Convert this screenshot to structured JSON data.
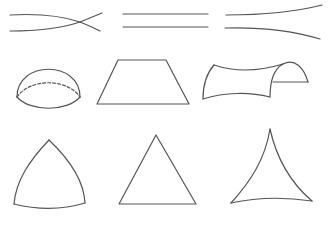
{
  "diagram": {
    "stroke_color": "#555555",
    "background": "#ffffff",
    "rows": [
      {
        "name": "lines",
        "items": [
          {
            "id": "converging-lines",
            "type": "lines",
            "geometry": "elliptic"
          },
          {
            "id": "parallel-lines",
            "type": "lines",
            "geometry": "euclidean"
          },
          {
            "id": "diverging-lines",
            "type": "lines",
            "geometry": "hyperbolic"
          }
        ]
      },
      {
        "name": "surfaces",
        "items": [
          {
            "id": "hemisphere",
            "type": "surface",
            "geometry": "elliptic"
          },
          {
            "id": "flat-plane",
            "type": "surface",
            "geometry": "euclidean"
          },
          {
            "id": "saddle-surface",
            "type": "surface",
            "geometry": "hyperbolic"
          }
        ]
      },
      {
        "name": "triangles",
        "items": [
          {
            "id": "spherical-triangle",
            "type": "triangle",
            "geometry": "elliptic"
          },
          {
            "id": "euclidean-triangle",
            "type": "triangle",
            "geometry": "euclidean"
          },
          {
            "id": "hyperbolic-triangle",
            "type": "triangle",
            "geometry": "hyperbolic"
          }
        ]
      }
    ]
  }
}
